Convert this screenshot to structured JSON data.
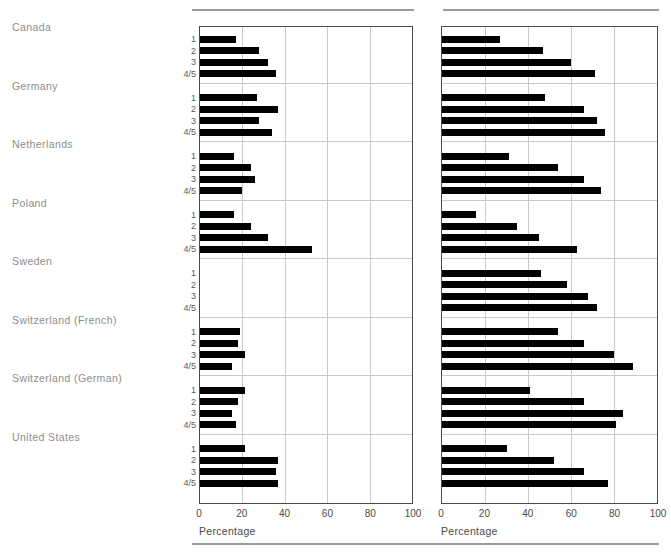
{
  "axis": {
    "title": "Percentage",
    "ticks": [
      0,
      20,
      40,
      60,
      80,
      100
    ],
    "tick_labels": [
      "0",
      "20",
      "40",
      "60",
      "80",
      "100"
    ]
  },
  "category_labels": [
    "1",
    "2",
    "3",
    "4/5"
  ],
  "countries": [
    "Canada",
    "Germany",
    "Netherlands",
    "Poland",
    "Sweden",
    "Switzerland (French)",
    "Switzerland (German)",
    "United States"
  ],
  "colors": {
    "bar": "#000000",
    "grid": "#c9c9c9",
    "frame": "#4a4a4a",
    "country_label": "#8d8d8d",
    "tick_label": "#5a5a5a",
    "rule": "#9a9a9a"
  },
  "chart_data": {
    "type": "bar",
    "orientation": "horizontal",
    "title": "",
    "subtitle": "",
    "xlabel": "Percentage",
    "ylabel": "",
    "xlim": [
      0,
      100
    ],
    "grid": true,
    "legend": "none",
    "categories": [
      "1",
      "2",
      "3",
      "4/5"
    ],
    "groups": [
      "Canada",
      "Germany",
      "Netherlands",
      "Poland",
      "Sweden",
      "Switzerland (French)",
      "Switzerland (German)",
      "United States"
    ],
    "panels": [
      {
        "name": "left-panel",
        "xlabel": "Percentage",
        "xlim": [
          0,
          100
        ],
        "series": [
          {
            "name": "Canada",
            "values": [
              17,
              28,
              32,
              36
            ]
          },
          {
            "name": "Germany",
            "values": [
              27,
              37,
              28,
              34
            ]
          },
          {
            "name": "Netherlands",
            "values": [
              16,
              24,
              26,
              20
            ]
          },
          {
            "name": "Poland",
            "values": [
              16,
              24,
              32,
              53
            ]
          },
          {
            "name": "Sweden",
            "values": [
              0,
              0,
              0,
              0
            ]
          },
          {
            "name": "Switzerland (French)",
            "values": [
              19,
              18,
              21,
              15
            ]
          },
          {
            "name": "Switzerland (German)",
            "values": [
              21,
              18,
              15,
              17
            ]
          },
          {
            "name": "United States",
            "values": [
              21,
              37,
              36,
              37
            ]
          }
        ]
      },
      {
        "name": "right-panel",
        "xlabel": "Percentage",
        "xlim": [
          0,
          100
        ],
        "series": [
          {
            "name": "Canada",
            "values": [
              27,
              47,
              60,
              71
            ]
          },
          {
            "name": "Germany",
            "values": [
              48,
              66,
              72,
              76
            ]
          },
          {
            "name": "Netherlands",
            "values": [
              31,
              54,
              66,
              74
            ]
          },
          {
            "name": "Poland",
            "values": [
              16,
              35,
              45,
              63
            ]
          },
          {
            "name": "Sweden",
            "values": [
              46,
              58,
              68,
              72
            ]
          },
          {
            "name": "Switzerland (French)",
            "values": [
              54,
              66,
              80,
              89
            ]
          },
          {
            "name": "Switzerland (German)",
            "values": [
              41,
              66,
              84,
              81
            ]
          },
          {
            "name": "United States",
            "values": [
              30,
              52,
              66,
              77
            ]
          }
        ]
      }
    ]
  }
}
